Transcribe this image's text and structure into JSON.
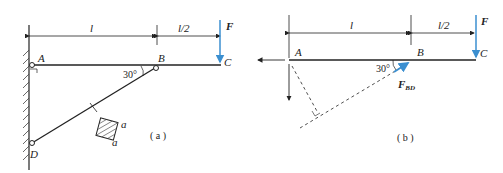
{
  "figure_a": {
    "points": {
      "A": "A",
      "B": "B",
      "C": "C",
      "D": "D"
    },
    "dim_left": "l",
    "dim_right": "l/2",
    "force": "F",
    "angle": "30°",
    "section_side_1": "a",
    "section_side_2": "a",
    "caption": "( a )"
  },
  "figure_b": {
    "points": {
      "A": "A",
      "B": "B",
      "C": "C"
    },
    "dim_left": "l",
    "dim_right": "l/2",
    "force": "F",
    "force_bd": "F",
    "force_bd_sub": "BD",
    "angle": "30°",
    "caption": "( b )"
  },
  "colors": {
    "force": "#3b8fd0",
    "line": "#222222"
  }
}
